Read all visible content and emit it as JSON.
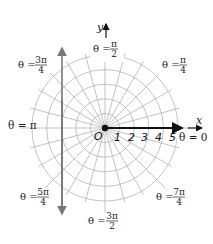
{
  "diagram": {
    "type": "polar-grid",
    "origin_label": "O",
    "x_axis_label": "x",
    "y_axis_label": "y",
    "radial_ticks": [
      "1",
      "2",
      "3",
      "4",
      "5"
    ],
    "circle_count": 5,
    "ray_step_degrees": 15,
    "angle_labels": {
      "theta0": {
        "lhs": "θ =",
        "num": "0",
        "den": ""
      },
      "theta45": {
        "lhs": "θ =",
        "num": "π",
        "den": "4"
      },
      "theta90": {
        "lhs": "θ =",
        "num": "π",
        "den": "2"
      },
      "theta135": {
        "lhs": "θ =",
        "num": "3π",
        "den": "4"
      },
      "theta180": {
        "lhs": "θ =",
        "num": "π",
        "den": ""
      },
      "theta225": {
        "lhs": "θ =",
        "num": "5π",
        "den": "4"
      },
      "theta270": {
        "lhs": "θ =",
        "num": "3π",
        "den": "2"
      },
      "theta315": {
        "lhs": "θ =",
        "num": "7π",
        "den": "4"
      }
    },
    "colors": {
      "grid": "#b4b4b4",
      "axis": "#111111",
      "vertical_line": "#777777",
      "text": "#222222"
    }
  }
}
